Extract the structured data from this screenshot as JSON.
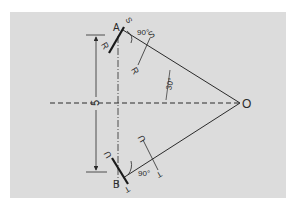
{
  "diagram": {
    "points": {
      "A": "A",
      "B": "B",
      "O": "O"
    },
    "dimension": {
      "label": "5"
    },
    "angles": {
      "right_angle_top": "90°",
      "right_angle_bottom": "90°",
      "half_angle": "30°"
    },
    "upper_section": {
      "top_label": "S",
      "mid_top_label": "S",
      "left_label": "R",
      "mid_bottom_label": "R"
    },
    "lower_section": {
      "top_label": "U",
      "mid_top_label": "U",
      "bottom_label": "T",
      "mid_bottom_label": "T"
    },
    "colors": {
      "panel": "#dcdcdc",
      "ink": "#2a2a2a",
      "background": "#ffffff"
    }
  }
}
